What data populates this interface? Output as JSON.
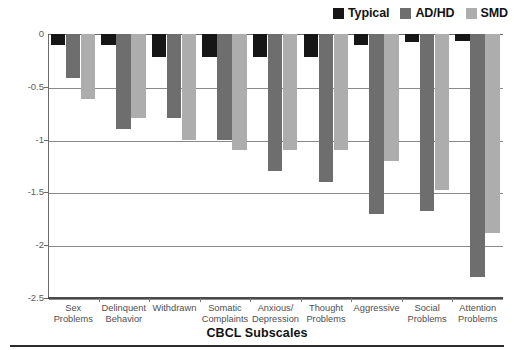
{
  "chart_data": {
    "type": "bar",
    "title": "",
    "xlabel": "CBCL Subscales",
    "ylabel": "",
    "ylim": [
      -2.5,
      0
    ],
    "yticks": [
      0,
      -0.5,
      -1,
      -1.5,
      -2,
      -2.5
    ],
    "ytick_labels": [
      "0",
      "-0.5",
      "-1",
      "-1.5",
      "-2",
      "-2.5"
    ],
    "grid": true,
    "legend_position": "top-right",
    "orientation": "vertical-negative",
    "categories": [
      "Sex Problems",
      "Delinquent Behavior",
      "Withdrawn",
      "Somatic Complaints",
      "Anxious/ Depression",
      "Thought Problems",
      "Aggressive",
      "Social Problems",
      "Attention Problems"
    ],
    "category_lines": [
      [
        "Sex",
        "Problems"
      ],
      [
        "Delinquent",
        "Behavior"
      ],
      [
        "Withdrawn",
        ""
      ],
      [
        "Somatic",
        "Complaints"
      ],
      [
        "Anxious/",
        "Depression"
      ],
      [
        "Thought",
        "Problems"
      ],
      [
        "Aggressive",
        ""
      ],
      [
        "Social",
        "Problems"
      ],
      [
        "Attention",
        "Problems"
      ]
    ],
    "series": [
      {
        "name": "Typical",
        "color": "#161616",
        "values": [
          -0.1,
          -0.1,
          -0.22,
          -0.22,
          -0.22,
          -0.22,
          -0.1,
          -0.08,
          -0.07
        ]
      },
      {
        "name": "AD/HD",
        "color": "#6e6e6e",
        "values": [
          -0.42,
          -0.9,
          -0.8,
          -1.0,
          -1.3,
          -1.4,
          -1.7,
          -1.68,
          -2.3
        ]
      },
      {
        "name": "SMD",
        "color": "#adadad",
        "values": [
          -0.62,
          -0.8,
          -1.0,
          -1.1,
          -1.1,
          -1.1,
          -1.2,
          -1.48,
          -1.88
        ]
      }
    ]
  },
  "legend": {
    "entries": [
      {
        "label": "Typical",
        "color": "#161616"
      },
      {
        "label": "AD/HD",
        "color": "#6e6e6e"
      },
      {
        "label": "SMD",
        "color": "#adadad"
      }
    ]
  }
}
